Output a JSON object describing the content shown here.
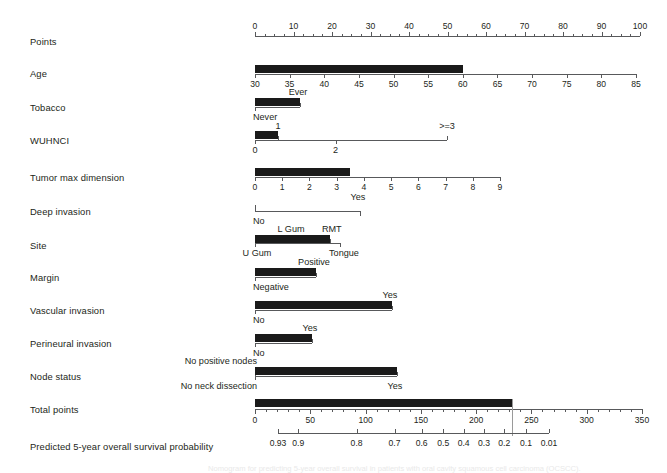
{
  "figure": {
    "type": "nomogram",
    "title": "",
    "caption": "Nomogram for predicting 5-year overall survival in patients with oral cavity squamous cell carcinoma (OCSCC).",
    "colors": {
      "bar": "#1a1a1a",
      "axis": "#58595b",
      "text": "#231f20",
      "readout": "#9a9a9a"
    }
  },
  "rows": [
    {
      "id": "points",
      "label": "Points",
      "kind": "scale",
      "ticks": [
        0,
        10,
        20,
        30,
        40,
        50,
        60,
        70,
        80,
        90,
        100
      ],
      "range": [
        0,
        100
      ],
      "bar_value": null
    },
    {
      "id": "age",
      "label": "Age",
      "kind": "scale",
      "ticks": [
        30,
        35,
        40,
        45,
        50,
        55,
        60,
        65,
        70,
        75,
        80,
        85
      ],
      "range": [
        30,
        85
      ],
      "bar_value": 60
    },
    {
      "id": "tobacco",
      "label": "Tobacco",
      "kind": "categorical",
      "categories": [
        "Never",
        "Ever"
      ],
      "cat_positions": [
        0,
        100
      ],
      "bar_value": 100
    },
    {
      "id": "wuhnci",
      "label": "WUHNCI",
      "kind": "scale",
      "ticks": [
        "0",
        "1",
        "2",
        ">=3"
      ],
      "tick_positions": [
        0,
        12,
        42,
        100
      ],
      "bar_value": 12
    },
    {
      "id": "tumor-max-dimension",
      "label": "Tumor max dimension",
      "kind": "scale",
      "ticks": [
        0,
        1,
        2,
        3,
        4,
        5,
        6,
        7,
        8,
        9
      ],
      "range": [
        0,
        9
      ],
      "bar_value": 3.5
    },
    {
      "id": "deep-invasion",
      "label": "Deep invasion",
      "kind": "categorical",
      "categories": [
        "No",
        "Yes"
      ],
      "cat_positions": [
        0,
        100
      ],
      "bar_value": null
    },
    {
      "id": "site",
      "label": "Site",
      "kind": "categorical",
      "categories": [
        "U Gum",
        "L Gum",
        "RMT",
        "Tongue"
      ],
      "cat_positions": [
        0,
        33,
        88,
        100
      ],
      "bar_value": 88
    },
    {
      "id": "margin",
      "label": "Margin",
      "kind": "categorical",
      "categories": [
        "Negative",
        "Positive"
      ],
      "cat_positions": [
        0,
        100
      ],
      "bar_value": 100
    },
    {
      "id": "vascular-invasion",
      "label": "Vascular invasion",
      "kind": "categorical",
      "categories": [
        "No",
        "Yes"
      ],
      "cat_positions": [
        0,
        100
      ],
      "bar_value": 100
    },
    {
      "id": "perineural-invasion",
      "label": "Perineural invasion",
      "kind": "categorical",
      "categories": [
        "No",
        "Yes"
      ],
      "cat_positions": [
        0,
        100
      ],
      "bar_value": 100
    },
    {
      "id": "node-status",
      "label": "Node status",
      "kind": "categorical",
      "categories": [
        "No neck dissection",
        "No positive nodes",
        "Yes"
      ],
      "cat_positions": [
        0,
        0,
        100
      ],
      "bar_value": 100
    },
    {
      "id": "total-points",
      "label": "Total points",
      "kind": "scale",
      "ticks": [
        0,
        50,
        100,
        150,
        200,
        250,
        300,
        350
      ],
      "range": [
        0,
        350
      ],
      "bar_value": 232
    },
    {
      "id": "survival",
      "label": "Predicted 5-year overall survival probability",
      "kind": "probability",
      "ticks": [
        "0.93",
        "0.9",
        "0.8",
        "0.7",
        "0.6",
        "0.5",
        "0.4",
        "0.3",
        "0.2",
        "0.1",
        "0.01"
      ],
      "readout": "0.1"
    }
  ],
  "chart_data": {
    "type": "nomogram",
    "xlabel": "Points",
    "ylabel": "Predictor",
    "predictors": [
      {
        "name": "Points",
        "type": "axis",
        "min": 0,
        "max": 100,
        "tick_labels": [
          "0",
          "10",
          "20",
          "30",
          "40",
          "50",
          "60",
          "70",
          "80",
          "90",
          "100"
        ]
      },
      {
        "name": "Age",
        "type": "continuous",
        "min": 30,
        "max": 85,
        "tick_labels": [
          "30",
          "35",
          "40",
          "45",
          "50",
          "55",
          "60",
          "65",
          "70",
          "75",
          "80",
          "85"
        ],
        "points_span": [
          0,
          100
        ],
        "selected_value": 60,
        "selected_points": 55
      },
      {
        "name": "Tobacco",
        "type": "categorical",
        "levels": [
          "Never",
          "Ever"
        ],
        "level_points": [
          0,
          12
        ],
        "selected_level": "Ever"
      },
      {
        "name": "WUHNCI",
        "type": "ordinal",
        "levels": [
          "0",
          "1",
          "2",
          ">=3"
        ],
        "level_points": [
          0,
          6,
          20,
          50
        ],
        "selected_level": "1"
      },
      {
        "name": "Tumor max dimension",
        "type": "continuous",
        "min": 0,
        "max": 9,
        "tick_labels": [
          "0",
          "1",
          "2",
          "3",
          "4",
          "5",
          "6",
          "7",
          "8",
          "9"
        ],
        "points_span": [
          0,
          64
        ],
        "selected_value": 3.5,
        "selected_points": 25
      },
      {
        "name": "Deep invasion",
        "type": "categorical",
        "levels": [
          "No",
          "Yes"
        ],
        "level_points": [
          0,
          45
        ],
        "selected_level": null
      },
      {
        "name": "Site",
        "type": "categorical",
        "levels": [
          "U Gum",
          "L Gum",
          "RMT",
          "Tongue"
        ],
        "level_points": [
          0,
          18,
          20,
          21
        ],
        "selected_level": "RMT"
      },
      {
        "name": "Margin",
        "type": "categorical",
        "levels": [
          "Negative",
          "Positive"
        ],
        "level_points": [
          0,
          16
        ],
        "selected_level": "Positive"
      },
      {
        "name": "Vascular invasion",
        "type": "categorical",
        "levels": [
          "No",
          "Yes"
        ],
        "level_points": [
          0,
          36
        ],
        "selected_level": "Yes"
      },
      {
        "name": "Perineural invasion",
        "type": "categorical",
        "levels": [
          "No",
          "Yes"
        ],
        "level_points": [
          0,
          15
        ],
        "selected_level": "Yes"
      },
      {
        "name": "Node status",
        "type": "categorical",
        "levels": [
          "No neck dissection",
          "No positive nodes",
          "Yes"
        ],
        "level_points": [
          0,
          0,
          37
        ],
        "selected_level": "Yes"
      },
      {
        "name": "Total points",
        "type": "axis",
        "min": 0,
        "max": 350,
        "tick_labels": [
          "0",
          "50",
          "100",
          "150",
          "200",
          "250",
          "300",
          "350"
        ],
        "selected_value": 232
      },
      {
        "name": "Predicted 5-year overall survival probability",
        "type": "probability_axis",
        "tick_labels": [
          "0.93",
          "0.9",
          "0.8",
          "0.7",
          "0.6",
          "0.5",
          "0.4",
          "0.3",
          "0.2",
          "0.1",
          "0.01"
        ],
        "readout_value": 0.1
      }
    ],
    "grid": false,
    "legend": "none"
  }
}
